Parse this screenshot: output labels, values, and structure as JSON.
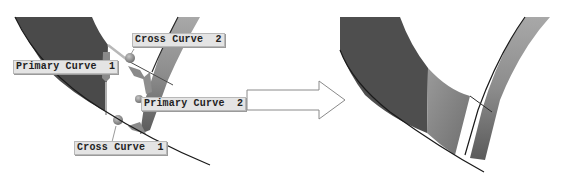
{
  "before": {
    "labels": {
      "primary_curve_1": "Primary Curve  1",
      "cross_curve_2": "Cross Curve  2",
      "primary_curve_2": "Primary Curve  2",
      "cross_curve_1": "Cross Curve  1"
    }
  },
  "transition": {
    "icon": "right-arrow-icon"
  },
  "colors": {
    "surface_dark": "#4a4a4a",
    "surface_mid": "#7a7a7a",
    "surface_light": "#9c9c9c",
    "curve_line": "#1a1a1a",
    "handle": "#8a8a8a",
    "label_bg": "#e4e4e4"
  }
}
